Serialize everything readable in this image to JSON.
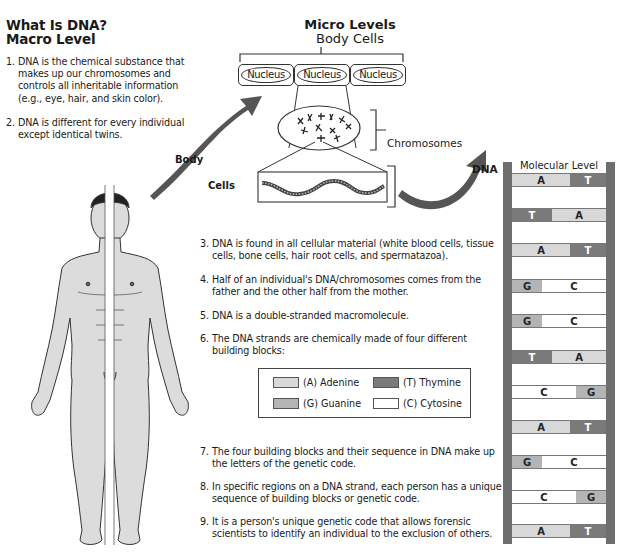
{
  "macro": {
    "title_line1": "What Is DNA?",
    "title_line2": "Macro Level",
    "points": [
      {
        "num": "1.",
        "lines": [
          "DNA is the chemical substance that",
          "makes up our chromosomes and",
          "controls all inheritable information",
          "(e.g., eye, hair, and skin color)."
        ]
      },
      {
        "num": "2.",
        "lines": [
          "DNA is different for every individual",
          "except identical twins."
        ]
      }
    ]
  },
  "micro": {
    "title_bold": "Micro Levels",
    "subtitle": "Body Cells",
    "nuclei": [
      "Nucleus",
      "Nucleus",
      "Nucleus"
    ],
    "chromosomes_label": "Chromosomes"
  },
  "arrows": {
    "body_label": "Body",
    "cells_label": "Cells",
    "dna_label": "DNA"
  },
  "molecular": {
    "title": "Molecular Level",
    "rungs": [
      {
        "left": "A",
        "right": "T"
      },
      {
        "left": "T",
        "right": "A"
      },
      {
        "left": "A",
        "right": "T"
      },
      {
        "left": "G",
        "right": "C"
      },
      {
        "left": "G",
        "right": "C"
      },
      {
        "left": "T",
        "right": "A"
      },
      {
        "left": "C",
        "right": "G"
      },
      {
        "left": "A",
        "right": "T"
      },
      {
        "left": "G",
        "right": "C"
      },
      {
        "left": "C",
        "right": "G"
      },
      {
        "left": "A",
        "right": "T"
      }
    ],
    "colors": {
      "A": "#d8d8d8",
      "T": "#7a7a7a",
      "G": "#b4b4b4",
      "C": "#ffffff",
      "rail": "#6e6e6e"
    }
  },
  "points_lower": [
    {
      "num": "3.",
      "lines": [
        "DNA is found in all cellular material (white blood cells, tissue",
        "cells, bone cells, hair root cells, and spermatazoa)."
      ]
    },
    {
      "num": "4.",
      "lines": [
        "Half of an individual's DNA/chromosomes comes from the",
        "father and the other half from the mother."
      ]
    },
    {
      "num": "5.",
      "lines": [
        "DNA is a double-stranded macromolecule."
      ]
    },
    {
      "num": "6.",
      "lines": [
        "The DNA strands are chemically made of four different",
        "building blocks:"
      ]
    },
    {
      "num": "7.",
      "lines": [
        "The four building blocks and their sequence in DNA make up",
        "the letters of the genetic code."
      ]
    },
    {
      "num": "8.",
      "lines": [
        "In specific regions on a DNA strand, each person has a unique",
        "sequence of building blocks or genetic code."
      ]
    },
    {
      "num": "9.",
      "lines": [
        "It is a person's unique genetic code that allows forensic",
        "scientists to identify an individual to the exclusion of others."
      ]
    }
  ],
  "legend": [
    {
      "label": "(A) Adenine",
      "color": "#d8d8d8"
    },
    {
      "label": "(T) Thymine",
      "color": "#7a7a7a"
    },
    {
      "label": "(G) Guanine",
      "color": "#b4b4b4"
    },
    {
      "label": "(C) Cytosine",
      "color": "#ffffff"
    }
  ]
}
